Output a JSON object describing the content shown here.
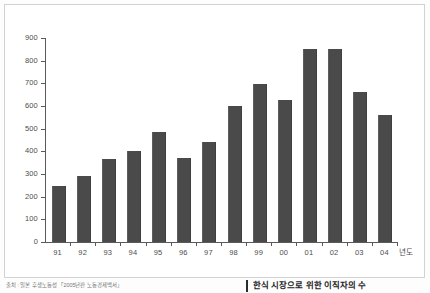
{
  "chart_data": {
    "type": "bar",
    "title": "",
    "xlabel": "년도",
    "ylabel": "",
    "categories": [
      "91",
      "92",
      "93",
      "94",
      "95",
      "96",
      "97",
      "98",
      "99",
      "00",
      "01",
      "02",
      "03",
      "04"
    ],
    "values": [
      245,
      290,
      365,
      400,
      485,
      370,
      440,
      600,
      695,
      625,
      850,
      850,
      660,
      560
    ],
    "yticks": [
      0,
      100,
      200,
      300,
      400,
      500,
      600,
      700,
      800,
      900
    ],
    "ylim": [
      0,
      900
    ],
    "grid": false,
    "legend": null,
    "series": [
      {
        "name": "",
        "values": [
          245,
          290,
          365,
          400,
          485,
          370,
          440,
          600,
          695,
          625,
          850,
          850,
          660,
          560
        ]
      }
    ],
    "bar_color": "#4a4a4a",
    "axis_color": "#5a5a5a",
    "plot_background": "#ffffff"
  },
  "captions": {
    "source_note": "출처 : 일본 후생노동성 「2005년판 노동경제백서」",
    "figure_caption": "한식 시장으로 위한 이직자의 수"
  }
}
